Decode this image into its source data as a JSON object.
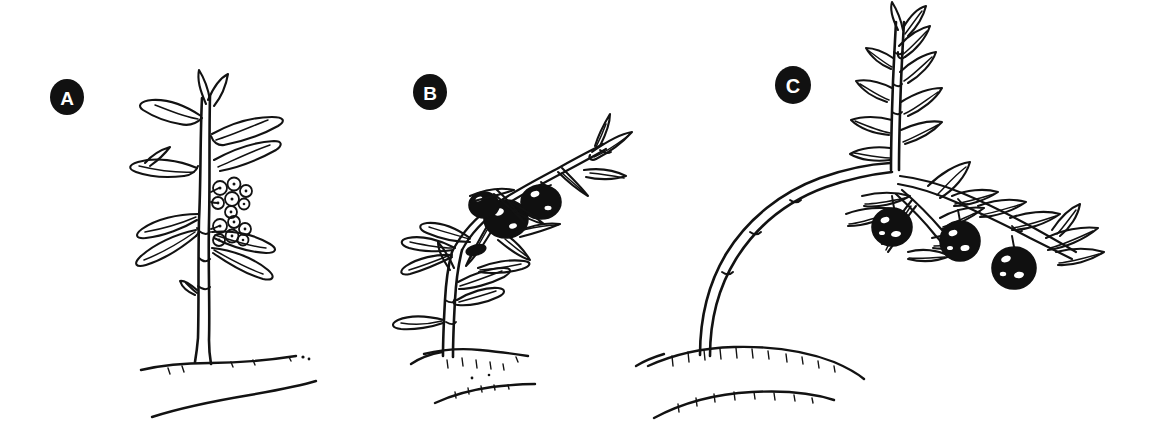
{
  "figure": {
    "background_color": "#ffffff",
    "ink_color": "#121212",
    "fruit_color": "#101010",
    "label_disc_color": "#111111",
    "label_text_color": "#ffffff",
    "style": "black-and-white pen-and-ink botanical line drawing",
    "width": 1169,
    "height": 444
  },
  "panels": [
    {
      "id": "a",
      "label": "A",
      "label_cx": 67,
      "label_cy": 97,
      "label_r": 17,
      "stage": "flowering",
      "description": "Upright straight stem with paired lance-shaped leaves and two clusters of small white star flowers at mid-stem; flat level ground line.",
      "fruit_count": 0,
      "flower_clusters": 2,
      "stem_posture": "erect",
      "ground_profile": "flat"
    },
    {
      "id": "b",
      "label": "B",
      "label_cx": 430,
      "label_cy": 92,
      "label_r": 17,
      "stage": "fruiting",
      "description": "Stem leaning and arching to the upper right under the weight of a cluster of two to three dark ripe berries nested among leaves; slightly mounded ground with scattered soil specks.",
      "fruit_count": 3,
      "flower_clusters": 0,
      "stem_posture": "leaning",
      "ground_profile": "slight-mound"
    },
    {
      "id": "c",
      "label": "C",
      "label_cx": 793,
      "label_cy": 85,
      "label_r": 18,
      "stage": "heavy-fruit-lodging",
      "description": "Long stem bowed over in a deep arch from the soil, rising again into an upright leafy shoot; a lateral fruiting branch carries three large dark hanging berries; raised mound of soil at the base.",
      "fruit_count": 3,
      "flower_clusters": 0,
      "stem_posture": "arched",
      "ground_profile": "mound"
    }
  ]
}
